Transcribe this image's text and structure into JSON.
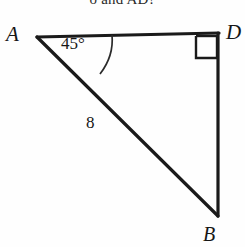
{
  "figure": {
    "caption_fragment": "o  and AD?",
    "stroke_color": "#1a1a1a",
    "background_color": "#fefefe",
    "vertices": {
      "A": {
        "label": "A",
        "x": 37,
        "y": 37
      },
      "D": {
        "label": "D",
        "x": 218,
        "y": 35
      },
      "B": {
        "label": "B",
        "x": 218,
        "y": 215
      }
    },
    "angle_marks": [
      {
        "name": "angle-at-A",
        "label": "45°",
        "value": 45,
        "unit": "degrees",
        "at_vertex": "A"
      },
      {
        "name": "right-angle-at-D",
        "label": "",
        "value": 90,
        "unit": "degrees",
        "at_vertex": "D",
        "marker": "square"
      }
    ],
    "side_labels": [
      {
        "name": "hypotenuse-AB",
        "label": "8",
        "value": 8,
        "between": "A-B"
      }
    ],
    "segments": [
      {
        "name": "segment-AD",
        "from": "A",
        "to": "D"
      },
      {
        "name": "segment-DB",
        "from": "D",
        "to": "B"
      },
      {
        "name": "segment-AB",
        "from": "A",
        "to": "B"
      }
    ]
  }
}
